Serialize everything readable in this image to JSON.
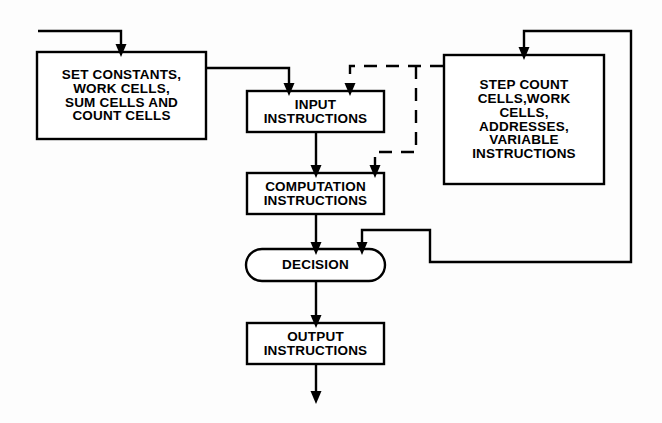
{
  "diagram": {
    "background_color": "#fdfdfd",
    "line_color": "#000000",
    "text_color": "#000000",
    "nodes": {
      "set_constants": {
        "shape": "rectangle",
        "lines": [
          "SET CONSTANTS,",
          "WORK CELLS,",
          "SUM CELLS AND",
          "COUNT CELLS"
        ],
        "x": 36,
        "y": 51,
        "w": 171,
        "h": 89,
        "font_size": 13.5
      },
      "input_instructions": {
        "shape": "rectangle",
        "lines": [
          "INPUT",
          "INSTRUCTIONS"
        ],
        "x": 246,
        "y": 90,
        "w": 139,
        "h": 43,
        "font_size": 13.5
      },
      "computation_instructions": {
        "shape": "rectangle",
        "lines": [
          "COMPUTATION",
          "INSTRUCTIONS"
        ],
        "x": 246,
        "y": 172,
        "w": 139,
        "h": 43,
        "font_size": 13.5
      },
      "decision": {
        "shape": "capsule",
        "lines": [
          "DECISION"
        ],
        "x": 245,
        "y": 248,
        "w": 141,
        "h": 34,
        "font_size": 13.5
      },
      "output_instructions": {
        "shape": "rectangle",
        "lines": [
          "OUTPUT",
          "INSTRUCTIONS"
        ],
        "x": 246,
        "y": 322,
        "w": 139,
        "h": 43,
        "font_size": 13.5
      },
      "step_count": {
        "shape": "rectangle",
        "lines": [
          "STEP COUNT",
          "CELLS,WORK",
          "CELLS,",
          "ADDRESSES,",
          "VARIABLE",
          "INSTRUCTIONS"
        ],
        "x": 443,
        "y": 54,
        "w": 162,
        "h": 131,
        "font_size": 13.5
      }
    },
    "edges": [
      {
        "name": "entry-to-set-constants",
        "style": "solid",
        "points": "38,31 121,31 121,45",
        "arrow": "down"
      },
      {
        "name": "set-constants-to-input",
        "style": "solid",
        "points": "207,68 289,68 289,84",
        "arrow": "down"
      },
      {
        "name": "input-to-computation",
        "style": "solid",
        "points": "316,133 316,166",
        "arrow": "down"
      },
      {
        "name": "computation-to-decision",
        "style": "solid",
        "points": "316,215 316,243",
        "arrow": "down"
      },
      {
        "name": "decision-to-output",
        "style": "solid",
        "points": "316,282 316,316",
        "arrow": "down"
      },
      {
        "name": "output-to-exit",
        "style": "solid",
        "points": "316,365 316,392",
        "arrow": "down"
      },
      {
        "name": "step-count-loopback-top",
        "style": "solid",
        "points": "631,185 631,31 524,31 524,48",
        "arrow": "down"
      },
      {
        "name": "decision-to-step-count-right",
        "style": "solid",
        "points": "631,185 631,262 430,262 430,230 362,230 362,243",
        "arrow": "down"
      },
      {
        "name": "step-count-dashed-to-input",
        "style": "dashed",
        "points": "443,66 350,66 350,84",
        "arrow": "down"
      },
      {
        "name": "step-count-dashed-to-computation",
        "style": "dashed",
        "points": "416,66 416,152 375,152 375,166",
        "arrow": "down"
      }
    ],
    "arrowhead": {
      "width": 11,
      "height": 13
    }
  }
}
